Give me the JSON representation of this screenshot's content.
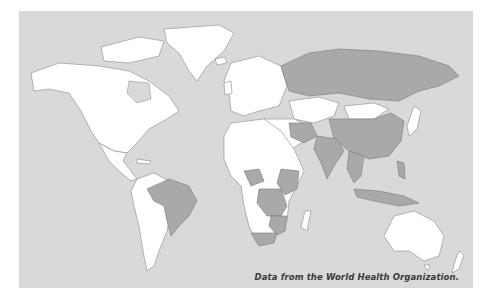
{
  "map": {
    "type": "choropleth world map",
    "colors": {
      "ocean": "#d9d9d9",
      "no_data_or_other": "#ffffff",
      "highlighted": "#a9a9a9",
      "border": "#8a8a8a"
    },
    "highlighted_regions": [
      "Russia",
      "China",
      "India",
      "Southeast Asia",
      "Indonesia",
      "Philippines",
      "Iran",
      "Turkey region",
      "Brazil",
      "Uruguay",
      "Nigeria",
      "Ethiopia",
      "Kenya",
      "Democratic Republic of the Congo",
      "Tanzania",
      "Mozambique",
      "Zambia",
      "South Africa"
    ],
    "white_regions": [
      "North America",
      "Greenland",
      "Central America",
      "South America (excluding Brazil)",
      "Europe",
      "North Africa",
      "Kazakhstan",
      "Mongolia",
      "Australia",
      "New Zealand",
      "Madagascar"
    ]
  },
  "caption": "Data from the World Health Organization."
}
